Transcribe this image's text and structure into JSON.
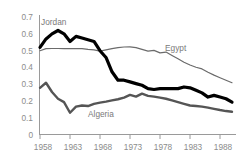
{
  "chart": {
    "title_partial": "",
    "background": "#ffffff"
  },
  "axes": {
    "y_ticks": [
      "0.7",
      "0.6",
      "0.5",
      "0.4",
      "0.3",
      "0.2",
      "0.1",
      "0"
    ],
    "x_ticks": [
      "1958",
      "1963",
      "1968",
      "1973",
      "1978",
      "1983",
      "1988"
    ]
  },
  "labels": {
    "jordan": "Jordan",
    "egypt": "Egypt",
    "algeria": "Algeria"
  },
  "chart_data": {
    "type": "line",
    "title": "",
    "xlabel": "",
    "ylabel": "",
    "xlim": [
      1958,
      1990
    ],
    "ylim": [
      0,
      0.7
    ],
    "grid": false,
    "legend": "inline-annotations",
    "x": [
      1958,
      1959,
      1960,
      1961,
      1962,
      1963,
      1964,
      1965,
      1966,
      1967,
      1968,
      1969,
      1970,
      1971,
      1972,
      1973,
      1974,
      1975,
      1976,
      1977,
      1978,
      1979,
      1980,
      1981,
      1982,
      1983,
      1984,
      1985,
      1986,
      1987,
      1988,
      1989,
      1990
    ],
    "series": [
      {
        "name": "Jordan",
        "color": "#000000",
        "stroke_width": 3.2,
        "values": [
          0.52,
          0.57,
          0.6,
          0.62,
          0.6,
          0.555,
          0.585,
          0.575,
          0.565,
          0.555,
          0.5,
          0.46,
          0.375,
          0.325,
          0.325,
          0.315,
          0.305,
          0.295,
          0.275,
          0.27,
          0.275,
          0.275,
          0.275,
          0.275,
          0.285,
          0.28,
          0.265,
          0.25,
          0.225,
          0.235,
          0.225,
          0.215,
          0.195
        ]
      },
      {
        "name": "Egypt",
        "color": "#6b6b6b",
        "stroke_width": 1.2,
        "values": [
          0.5,
          0.512,
          0.513,
          0.513,
          0.512,
          0.512,
          0.513,
          0.512,
          0.508,
          0.505,
          0.498,
          0.505,
          0.512,
          0.518,
          0.522,
          0.523,
          0.518,
          0.508,
          0.498,
          0.502,
          0.487,
          0.492,
          0.472,
          0.452,
          0.432,
          0.415,
          0.402,
          0.392,
          0.372,
          0.355,
          0.34,
          0.325,
          0.31
        ]
      },
      {
        "name": "Algeria",
        "color": "#555555",
        "stroke_width": 2.4,
        "values": [
          0.28,
          0.31,
          0.255,
          0.215,
          0.195,
          0.132,
          0.168,
          0.175,
          0.172,
          0.185,
          0.192,
          0.198,
          0.205,
          0.212,
          0.222,
          0.238,
          0.228,
          0.245,
          0.232,
          0.228,
          0.222,
          0.215,
          0.205,
          0.195,
          0.185,
          0.175,
          0.172,
          0.168,
          0.162,
          0.155,
          0.148,
          0.142,
          0.138
        ]
      }
    ]
  }
}
